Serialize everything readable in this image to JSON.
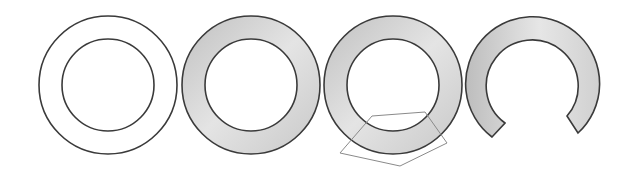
{
  "diagram": {
    "colors": {
      "background": "#ffffff",
      "stroke": "#3a3a3a",
      "fill_light": "#eeeeee",
      "fill_dark": "#c4c4c4",
      "polygon_stroke": "#8a8a8a"
    },
    "rings": [
      {
        "id": "ring-outline",
        "cx": 108,
        "cy": 85,
        "r_outer": 69,
        "r_inner": 46,
        "filled": false
      },
      {
        "id": "ring-filled",
        "cx": 251,
        "cy": 85,
        "r_outer": 69,
        "r_inner": 46,
        "filled": true
      },
      {
        "id": "ring-with-pentagon",
        "cx": 393,
        "cy": 85,
        "r_outer": 69,
        "r_inner": 46,
        "filled": true
      },
      {
        "id": "ring-cut",
        "cx": 533,
        "cy": 84,
        "r_outer": 67,
        "r_inner": 46,
        "filled": true,
        "gap": "bottom"
      }
    ],
    "pentagon": {
      "points": [
        [
          340,
          153
        ],
        [
          372,
          116
        ],
        [
          425,
          112
        ],
        [
          447,
          143
        ],
        [
          400,
          166
        ]
      ]
    }
  }
}
